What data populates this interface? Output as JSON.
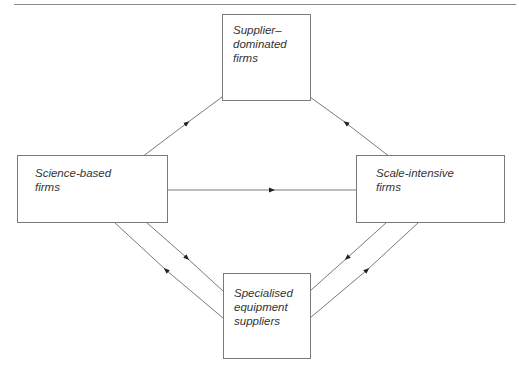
{
  "diagram": {
    "type": "flow",
    "nodes": [
      {
        "id": "supplier",
        "label": "Supplier–\ndominated\nfirms"
      },
      {
        "id": "science",
        "label": "Science-based\nfirms"
      },
      {
        "id": "scale",
        "label": "Scale-intensive\nfirms"
      },
      {
        "id": "specialised",
        "label": "Specialised\nequipment\nsuppliers"
      }
    ],
    "edges": [
      {
        "from": "science",
        "to": "supplier"
      },
      {
        "from": "scale",
        "to": "supplier"
      },
      {
        "from": "science",
        "to": "scale"
      },
      {
        "from": "science",
        "to": "specialised"
      },
      {
        "from": "specialised",
        "to": "science"
      },
      {
        "from": "scale",
        "to": "specialised"
      },
      {
        "from": "specialised",
        "to": "scale"
      }
    ],
    "colors": {
      "line": "#7a7a7a",
      "arrow": "#222222",
      "text": "#333333"
    }
  }
}
